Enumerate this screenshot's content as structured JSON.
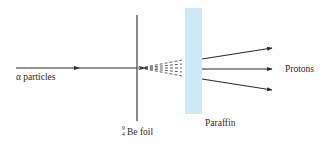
{
  "diagram": {
    "labels": {
      "alpha": "α particles",
      "foil_mass": "9",
      "foil_atomic": "4",
      "foil": "Be foil",
      "paraffin": "Paraffin",
      "protons": "Protons"
    },
    "colors": {
      "line": "#2b2b2b",
      "paraffin_fill": "#cfe9f4",
      "background": "#ffffff"
    },
    "elements": {
      "incoming_beam": {
        "from": [
          16,
          68
        ],
        "to": [
          137,
          68
        ],
        "midpoint_arrow_x": 78
      },
      "foil_line": {
        "x": 137,
        "y_top": 15,
        "y_bottom": 121
      },
      "paraffin_slab": {
        "x": 185,
        "y": 8,
        "width": 17,
        "height": 106
      },
      "neutron_fan": {
        "origin": [
          140,
          68
        ],
        "end_x": 182,
        "rays": 5
      },
      "proton_arrows": [
        {
          "from": [
            202,
            59
          ],
          "to": [
            272,
            48
          ]
        },
        {
          "from": [
            202,
            69
          ],
          "to": [
            272,
            69
          ]
        },
        {
          "from": [
            202,
            79
          ],
          "to": [
            272,
            90
          ]
        }
      ]
    }
  }
}
